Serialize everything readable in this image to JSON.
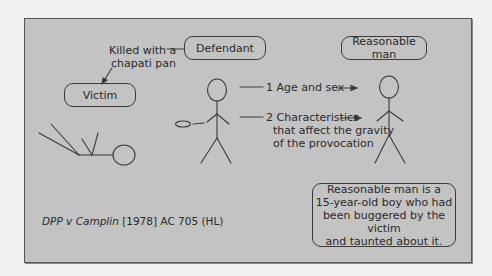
{
  "diagram": {
    "boxes": {
      "defendant": "Defendant",
      "victim": "Victim",
      "reasonable_man": "Reasonable man",
      "conclusion_lines": [
        "Reasonable man is a",
        "15-year-old boy who had",
        "been buggered by the victim",
        "and taunted about it."
      ]
    },
    "annotations": {
      "weapon_line1": "Killed with a",
      "weapon_line2": "chapati pan",
      "factor1": "1 Age and sex",
      "factor2_line1": "2 Characteristics",
      "factor2_line2": "that affect the gravity",
      "factor2_line3": "of the provocation"
    },
    "citation": {
      "case_name": "DPP v Camplin",
      "reference": " [1978] AC 705 (HL)"
    },
    "colors": {
      "page_bg": "#f1f1f1",
      "panel_bg": "#c3c3c3",
      "line": "#3a3a3a"
    }
  }
}
